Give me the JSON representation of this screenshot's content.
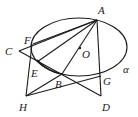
{
  "diagram": {
    "type": "geometry",
    "ellipse": {
      "cx": 79,
      "cy": 47,
      "rx": 48,
      "ry": 29
    },
    "plane_label": "α",
    "points": [
      {
        "id": "A",
        "label": "A",
        "x": 97,
        "y": 20,
        "lx": 98,
        "ly": 14
      },
      {
        "id": "O",
        "label": "O",
        "x": 80,
        "y": 48,
        "lx": 82,
        "ly": 57
      },
      {
        "id": "C",
        "label": "C",
        "x": 19,
        "y": 51,
        "lx": 6,
        "ly": 55
      },
      {
        "id": "F",
        "label": "F",
        "x": 32,
        "y": 47,
        "lx": 24,
        "ly": 44
      },
      {
        "id": "E",
        "label": "E",
        "x": 37,
        "y": 62,
        "lx": 31,
        "ly": 76
      },
      {
        "id": "B",
        "label": "B",
        "x": 62,
        "y": 74,
        "lx": 56,
        "ly": 87
      },
      {
        "id": "G",
        "label": "G",
        "x": 100,
        "y": 76,
        "lx": 103,
        "ly": 84
      },
      {
        "id": "H",
        "label": "H",
        "x": 26,
        "y": 96,
        "lx": 19,
        "ly": 110
      },
      {
        "id": "D",
        "label": "D",
        "x": 101,
        "y": 96,
        "lx": 102,
        "ly": 110
      }
    ],
    "segments": [
      [
        "A",
        "C"
      ],
      [
        "A",
        "E"
      ],
      [
        "A",
        "B"
      ],
      [
        "A",
        "D"
      ],
      [
        "A",
        "F"
      ],
      [
        "C",
        "D"
      ],
      [
        "H",
        "F"
      ],
      [
        "H",
        "B"
      ],
      [
        "H",
        "G"
      ]
    ],
    "alpha_label_pos": {
      "x": 123,
      "y": 72
    }
  }
}
